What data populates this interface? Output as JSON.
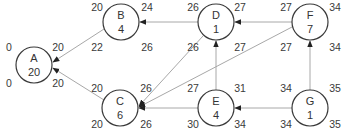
{
  "diagram": {
    "type": "activity-on-node network",
    "nodes": [
      {
        "id": "A",
        "duration": "20",
        "cx": 34,
        "cy": 65,
        "es": "0",
        "ef": "20",
        "ls": "0",
        "lf": "20"
      },
      {
        "id": "B",
        "duration": "4",
        "cx": 121,
        "cy": 22,
        "es": "20",
        "ef": "24",
        "ls": "22",
        "lf": "26"
      },
      {
        "id": "C",
        "duration": "6",
        "cx": 120,
        "cy": 108,
        "es": "20",
        "ef": "26",
        "ls": "20",
        "lf": "26"
      },
      {
        "id": "D",
        "duration": "1",
        "cx": 216,
        "cy": 22,
        "es": "26",
        "ef": "27",
        "ls": "26",
        "lf": "27"
      },
      {
        "id": "E",
        "duration": "4",
        "cx": 216,
        "cy": 108,
        "es": "27",
        "ef": "31",
        "ls": "30",
        "lf": "34"
      },
      {
        "id": "F",
        "duration": "7",
        "cx": 310,
        "cy": 22,
        "es": "27",
        "ef": "34",
        "ls": "27",
        "lf": "34"
      },
      {
        "id": "G",
        "duration": "1",
        "cx": 310,
        "cy": 108,
        "es": "34",
        "ef": "35",
        "ls": "34",
        "lf": "35"
      }
    ],
    "edges": [
      {
        "from": "B",
        "to": "A"
      },
      {
        "from": "C",
        "to": "A"
      },
      {
        "from": "D",
        "to": "B"
      },
      {
        "from": "D",
        "to": "C"
      },
      {
        "from": "F",
        "to": "C"
      },
      {
        "from": "E",
        "to": "C"
      },
      {
        "from": "E",
        "to": "D"
      },
      {
        "from": "F",
        "to": "D"
      },
      {
        "from": "G",
        "to": "E"
      },
      {
        "from": "G",
        "to": "F"
      }
    ],
    "colors": {
      "edge": "#a8a8a8",
      "arrowhead": "#222222",
      "node_stroke": "#3a3a3a",
      "text": "#333333"
    }
  }
}
